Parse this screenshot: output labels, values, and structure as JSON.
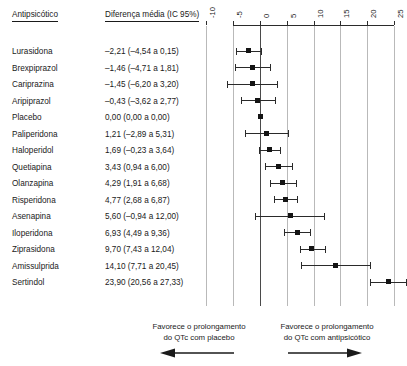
{
  "headers": {
    "drug": "Antipsicótico",
    "effect": "Diferença média (IC 95%)"
  },
  "footer": {
    "left_text": "Favorece o prolongamento\ndo QTc com placebo",
    "right_text": "Favorece o prolongamento\ndo QTc com antipsicótico",
    "left_arrow_icon": "arrow-left-icon",
    "right_arrow_icon": "arrow-right-icon"
  },
  "chart_data": {
    "type": "scatter",
    "subtype": "forest-plot",
    "title": "",
    "xlabel": "",
    "ylabel": "",
    "xlim": [
      -10,
      25
    ],
    "xticks": [
      -10,
      -5,
      0,
      5,
      10,
      15,
      20,
      25
    ],
    "xtick_labels": [
      "-10",
      "-5",
      "0",
      "5",
      "10",
      "15",
      "20",
      "25"
    ],
    "grid": true,
    "reference_line": 0,
    "legend": "none",
    "categories": [
      "Lurasidona",
      "Brexpiprazol",
      "Cariprazina",
      "Aripiprazol",
      "Placebo",
      "Paliperidona",
      "Haloperidol",
      "Quetiapina",
      "Olanzapina",
      "Risperidona",
      "Asenapina",
      "Iloperidona",
      "Ziprasidona",
      "Amissulprida",
      "Sertindol"
    ],
    "values": [
      -2.21,
      -1.46,
      -1.45,
      -0.43,
      0.0,
      1.21,
      1.69,
      3.43,
      4.29,
      4.77,
      5.6,
      6.93,
      9.7,
      14.1,
      23.9
    ],
    "ci_low": [
      -4.54,
      -4.71,
      -6.2,
      -3.62,
      0.0,
      -2.89,
      -0.23,
      0.94,
      1.91,
      2.68,
      -0.94,
      4.49,
      7.43,
      7.71,
      20.56
    ],
    "ci_high": [
      0.15,
      1.81,
      3.2,
      2.77,
      0.0,
      5.31,
      3.64,
      6.0,
      6.68,
      6.87,
      12.0,
      9.36,
      12.04,
      20.45,
      27.33
    ],
    "rows": [
      {
        "label": "Lurasidona",
        "value_text": "–2,21 (–4,54 a 0,15)",
        "mean": -2.21,
        "low": -4.54,
        "high": 0.15
      },
      {
        "label": "Brexpiprazol",
        "value_text": "–1,46 (–4,71 a 1,81)",
        "mean": -1.46,
        "low": -4.71,
        "high": 1.81
      },
      {
        "label": "Cariprazina",
        "value_text": "–1,45 (–6,20 a 3,20)",
        "mean": -1.45,
        "low": -6.2,
        "high": 3.2
      },
      {
        "label": "Aripiprazol",
        "value_text": "–0,43 (–3,62 a 2,77)",
        "mean": -0.43,
        "low": -3.62,
        "high": 2.77
      },
      {
        "label": "Placebo",
        "value_text": "0,00 (0,00 a 0,00)",
        "mean": 0.0,
        "low": 0.0,
        "high": 0.0
      },
      {
        "label": "Paliperidona",
        "value_text": "1,21 (–2,89 a 5,31)",
        "mean": 1.21,
        "low": -2.89,
        "high": 5.31
      },
      {
        "label": "Haloperidol",
        "value_text": "1,69 (–0,23 a 3,64)",
        "mean": 1.69,
        "low": -0.23,
        "high": 3.64
      },
      {
        "label": "Quetiapina",
        "value_text": "3,43 (0,94 a 6,00)",
        "mean": 3.43,
        "low": 0.94,
        "high": 6.0
      },
      {
        "label": "Olanzapina",
        "value_text": "4,29 (1,91 a 6,68)",
        "mean": 4.29,
        "low": 1.91,
        "high": 6.68
      },
      {
        "label": "Risperidona",
        "value_text": "4,77 (2,68 a 6,87)",
        "mean": 4.77,
        "low": 2.68,
        "high": 6.87
      },
      {
        "label": "Asenapina",
        "value_text": "5,60 (–0,94 a 12,00)",
        "mean": 5.6,
        "low": -0.94,
        "high": 12.0
      },
      {
        "label": "Iloperidona",
        "value_text": "6,93 (4,49 a 9,36)",
        "mean": 6.93,
        "low": 4.49,
        "high": 9.36
      },
      {
        "label": "Ziprasidona",
        "value_text": "9,70 (7,43 a 12,04)",
        "mean": 9.7,
        "low": 7.43,
        "high": 12.04
      },
      {
        "label": "Amissulprida",
        "value_text": "14,10 (7,71 a 20,45)",
        "mean": 14.1,
        "low": 7.71,
        "high": 20.45
      },
      {
        "label": "Sertindol",
        "value_text": "23,90 (20,56 a 27,33)",
        "mean": 23.9,
        "low": 20.56,
        "high": 27.33
      }
    ]
  }
}
